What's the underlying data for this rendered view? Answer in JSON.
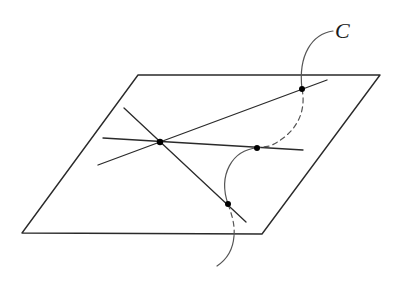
{
  "figure": {
    "curve_label": "C",
    "colors": {
      "background": "#ffffff",
      "lines": "#2a2a2a",
      "curve": "#555555",
      "points": "#000000"
    },
    "plane": {
      "shape": "parallelogram",
      "vertices": [
        [
          138,
          75
        ],
        [
          380,
          75
        ],
        [
          262,
          234
        ],
        [
          22,
          233
        ]
      ]
    },
    "lines": [
      {
        "name": "line-ascending",
        "from": [
          98,
          165
        ],
        "to": [
          327,
          80
        ]
      },
      {
        "name": "line-horizontal",
        "from": [
          103,
          138
        ],
        "to": [
          303,
          150
        ]
      },
      {
        "name": "line-descending",
        "from": [
          124,
          108
        ],
        "to": [
          246,
          222
        ]
      }
    ],
    "points": [
      {
        "name": "common-intersection-point",
        "at": [
          160,
          142
        ]
      },
      {
        "name": "curve-line-ascending-point",
        "at": [
          302,
          89
        ]
      },
      {
        "name": "curve-line-horizontal-point",
        "at": [
          257,
          148
        ]
      },
      {
        "name": "curve-line-descending-point",
        "at": [
          228,
          204
        ]
      }
    ],
    "curve_segments": [
      {
        "style": "solid",
        "from_label_to": "curve-line-ascending-point"
      },
      {
        "style": "dashed",
        "between": [
          "curve-line-ascending-point",
          "curve-line-horizontal-point"
        ]
      },
      {
        "style": "solid",
        "between": [
          "curve-line-horizontal-point",
          "curve-line-descending-point"
        ]
      },
      {
        "style": "dashed",
        "below_plane": true
      },
      {
        "style": "solid",
        "tail_end": [
          217,
          266
        ]
      }
    ]
  }
}
